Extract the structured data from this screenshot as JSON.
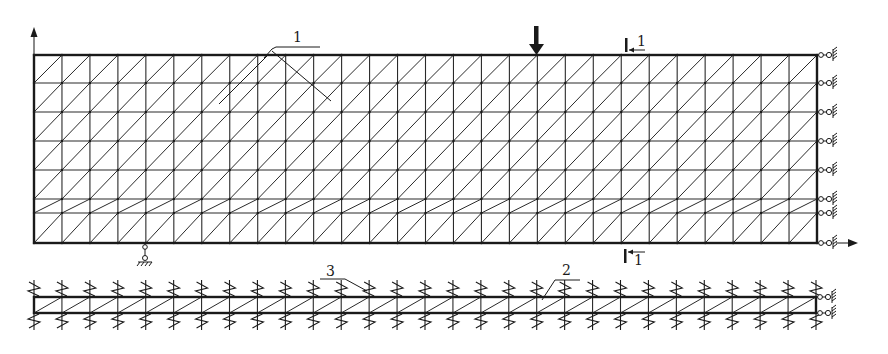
{
  "figure": {
    "width": 888,
    "height": 354,
    "colors": {
      "line": "#1a1a1a",
      "background": "#ffffff"
    }
  },
  "main_mesh": {
    "x_left": 34,
    "x_right": 817,
    "columns": 28,
    "row_y": [
      55,
      83,
      112,
      141,
      170,
      199,
      213,
      243
    ],
    "load_arrow_x": 536
  },
  "strip_mesh": {
    "x_left": 34,
    "x_right": 816,
    "columns": 28,
    "row_y": [
      297,
      313
    ]
  },
  "labels": {
    "label_1": "1",
    "label_2": "2",
    "label_3": "3",
    "section_top": "1",
    "section_bottom": "1"
  },
  "annotations": {
    "y_axis_arrow": "y-axis-arrow",
    "x_axis_arrow": "x-axis-arrow",
    "load_arrow": "downward-load-arrow",
    "pin_support": "pin-support"
  }
}
